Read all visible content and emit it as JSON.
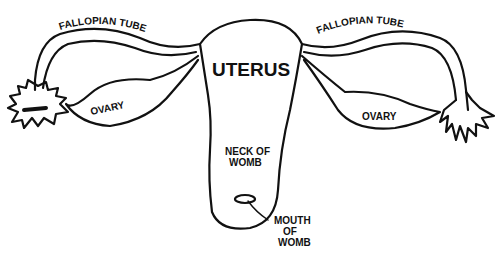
{
  "diagram": {
    "labels": {
      "uterus": "UTERUS",
      "fallopian_left": "FALLOPIAN TUBE",
      "fallopian_right": "FALLOPIAN TUBE",
      "ovary_left": "OVARY",
      "ovary_right": "OVARY",
      "neck_line1": "NECK OF",
      "neck_line2": "WOMB",
      "mouth_line1": "MOUTH",
      "mouth_line2": "OF",
      "mouth_line3": "WOMB"
    },
    "colors": {
      "ink": "#111111",
      "background": "#ffffff"
    }
  }
}
